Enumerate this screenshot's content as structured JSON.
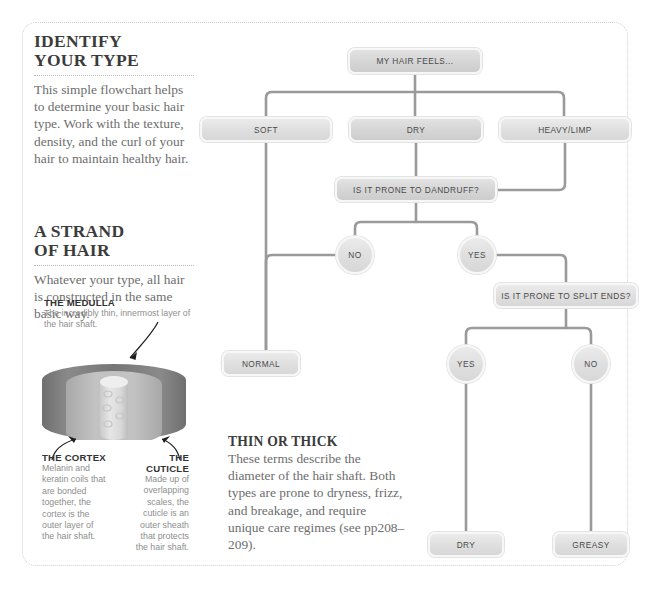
{
  "left_panel": {
    "identify": {
      "heading_line1": "IDENTIFY",
      "heading_line2": "YOUR TYPE",
      "body": "This simple flowchart helps to determine your basic hair type. Work with the texture, density, and the curl of your hair to maintain healthy hair."
    },
    "strand": {
      "heading_line1": "A STRAND",
      "heading_line2": "OF HAIR",
      "body": "Whatever your type, all hair is constructed in the same basic way."
    },
    "medulla": {
      "label": "THE MEDULLA",
      "text": "The incredibly thin, innermost layer of the hair shaft."
    },
    "cortex": {
      "label_line1": "THE CORTEX",
      "text": "Melanin and keratin coils that are bonded together, the cortex is the outer layer of the hair shaft."
    },
    "cuticle": {
      "label_line1": "THE",
      "label_line2": "CUTICLE",
      "text": "Made up of overlapping scales, the cuticle is an outer sheath that protects the hair shaft."
    }
  },
  "thin_or_thick": {
    "heading": "THIN OR THICK",
    "body": "These terms describe the diameter of the hair shaft. Both types are prone to dryness, frizz, and breakage, and require unique care regimes (see pp208–209)."
  },
  "flowchart": {
    "nodes": [
      {
        "id": "root",
        "label": "MY HAIR FEELS...",
        "shape": "pill",
        "x": 348,
        "y": 48,
        "w": 134,
        "h": 26
      },
      {
        "id": "soft",
        "label": "SOFT",
        "shape": "pill",
        "x": 200,
        "y": 117,
        "w": 132,
        "h": 25
      },
      {
        "id": "dry1",
        "label": "DRY",
        "shape": "pill",
        "x": 349,
        "y": 117,
        "w": 134,
        "h": 25
      },
      {
        "id": "heavy",
        "label": "HEAVY/LIMP",
        "shape": "pill",
        "x": 499,
        "y": 117,
        "w": 132,
        "h": 25
      },
      {
        "id": "dandruff",
        "label": "IS IT PRONE TO DANDRUFF?",
        "shape": "pill",
        "x": 335,
        "y": 177,
        "w": 162,
        "h": 25
      },
      {
        "id": "no1",
        "label": "NO",
        "shape": "circle",
        "x": 336,
        "y": 236,
        "w": 38,
        "h": 38
      },
      {
        "id": "yes1",
        "label": "YES",
        "shape": "circle",
        "x": 458,
        "y": 236,
        "w": 38,
        "h": 38
      },
      {
        "id": "split",
        "label": "IS IT PRONE TO SPLIT ENDS?",
        "shape": "pill",
        "x": 494,
        "y": 283,
        "w": 144,
        "h": 25
      },
      {
        "id": "normal",
        "label": "NORMAL",
        "shape": "pill",
        "x": 222,
        "y": 351,
        "w": 78,
        "h": 25
      },
      {
        "id": "yes2",
        "label": "YES",
        "shape": "circle",
        "x": 447,
        "y": 345,
        "w": 38,
        "h": 38
      },
      {
        "id": "no2",
        "label": "NO",
        "shape": "circle",
        "x": 572,
        "y": 345,
        "w": 38,
        "h": 38
      },
      {
        "id": "dry2",
        "label": "DRY",
        "shape": "pill",
        "x": 428,
        "y": 532,
        "w": 76,
        "h": 25
      },
      {
        "id": "greasy",
        "label": "GREASY",
        "shape": "pill",
        "x": 553,
        "y": 532,
        "w": 76,
        "h": 25
      }
    ]
  },
  "colors": {
    "node_fill": "#e0e0e0",
    "connector": "#9a9a9a",
    "panel_border": "#cfcfcf",
    "heading": "#3b3b3b",
    "body_text": "#6d6d6d"
  }
}
